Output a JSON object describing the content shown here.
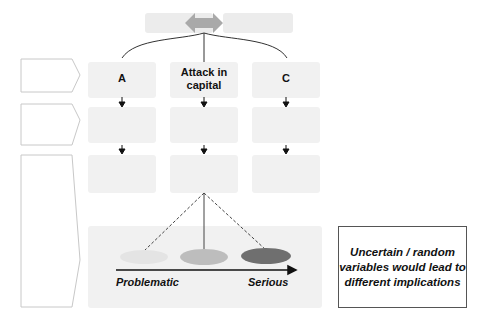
{
  "diagram": {
    "columns": [
      {
        "id": "A",
        "label": "A"
      },
      {
        "id": "B",
        "label": "Attack in\ncapital"
      },
      {
        "id": "C",
        "label": "C"
      }
    ],
    "severity_axis": {
      "left_label": "Problematic",
      "right_label": "Serious",
      "ellipse_colors": [
        "#e4e4e4",
        "#bdbdbd",
        "#6f6f6f"
      ]
    },
    "note": {
      "text": "Uncertain / random variables would lead to different implications"
    },
    "colors": {
      "blurred_box": "#ececec",
      "double_arrow": "#a9a9a9",
      "line": "#333333",
      "pentagon_border": "#c8c8c8"
    }
  }
}
